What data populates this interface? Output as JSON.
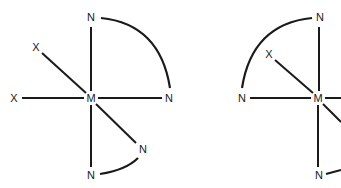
{
  "diagram": {
    "type": "coordination-complex-structures",
    "structures": [
      {
        "id": "left",
        "center": {
          "label": "M",
          "x": 91,
          "y": 98
        },
        "ligands": [
          {
            "label": "N",
            "x": 91,
            "y": 18,
            "position": "top"
          },
          {
            "label": "N",
            "x": 169,
            "y": 98,
            "position": "right"
          },
          {
            "label": "X",
            "x": 36,
            "y": 47,
            "position": "upper-left"
          },
          {
            "label": "X",
            "x": 14,
            "y": 98,
            "position": "left"
          },
          {
            "label": "N",
            "x": 143,
            "y": 149,
            "position": "lower-right"
          },
          {
            "label": "N",
            "x": 91,
            "y": 175,
            "position": "bottom"
          }
        ],
        "chelate_arcs": [
          {
            "from": "top N",
            "to": "right N"
          },
          {
            "from": "lower-right N",
            "to": "bottom N"
          }
        ]
      },
      {
        "id": "right",
        "center": {
          "label": "M",
          "x": 318,
          "y": 98
        },
        "ligands": [
          {
            "label": "N",
            "x": 320,
            "y": 18,
            "position": "top"
          },
          {
            "label": "N",
            "x": 242,
            "y": 98,
            "position": "left"
          },
          {
            "label": "X",
            "x": 268,
            "y": 54,
            "position": "upper-left"
          },
          {
            "label": "N",
            "x": 318,
            "y": 175,
            "position": "bottom"
          }
        ],
        "chelate_arcs": [
          {
            "from": "top N",
            "to": "left N"
          }
        ],
        "note": "structure cropped at right edge"
      }
    ],
    "colors": {
      "line": "#1a1a1a",
      "background": "#ffffff"
    }
  },
  "labels": {
    "l_M": "M",
    "l_Ntop": "N",
    "l_Nright": "N",
    "l_X1": "X",
    "l_X2": "X",
    "l_Nlr": "N",
    "l_Nbot": "N",
    "r_M": "M",
    "r_Ntop": "N",
    "r_Nleft": "N",
    "r_X": "X",
    "r_Nbot": "N"
  }
}
